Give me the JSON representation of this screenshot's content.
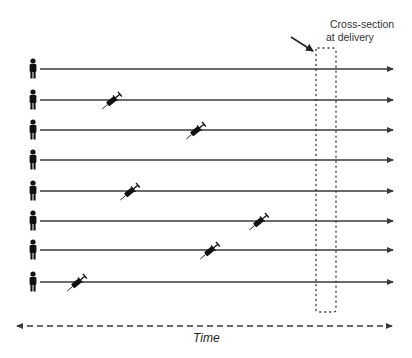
{
  "diagram": {
    "title": "",
    "annotation": {
      "line1": "Cross-section",
      "line2": "at delivery"
    },
    "axis_label": "Time",
    "colors": {
      "line": "#3a3a3a",
      "icon": "#111111",
      "background": "#ffffff"
    },
    "line_x_start": 40,
    "line_x_end": 393,
    "rows": [
      {
        "id": 1,
        "y": 69,
        "syringe_x": null
      },
      {
        "id": 2,
        "y": 100,
        "syringe_x": 113
      },
      {
        "id": 3,
        "y": 130,
        "syringe_x": 197
      },
      {
        "id": 4,
        "y": 160,
        "syringe_x": null
      },
      {
        "id": 5,
        "y": 191,
        "syringe_x": 131
      },
      {
        "id": 6,
        "y": 221,
        "syringe_x": 260
      },
      {
        "id": 7,
        "y": 250,
        "syringe_x": 211
      },
      {
        "id": 8,
        "y": 282,
        "syringe_x": 78
      }
    ],
    "cross_section_box": {
      "x": 316,
      "y": 48,
      "width": 20,
      "height": 264
    },
    "time_axis": {
      "y": 326,
      "x_start": 16,
      "x_end": 393,
      "style": "dashed",
      "direction": "bidirectional"
    },
    "icons": {
      "person": "person-icon",
      "syringe": "syringe-icon"
    }
  }
}
